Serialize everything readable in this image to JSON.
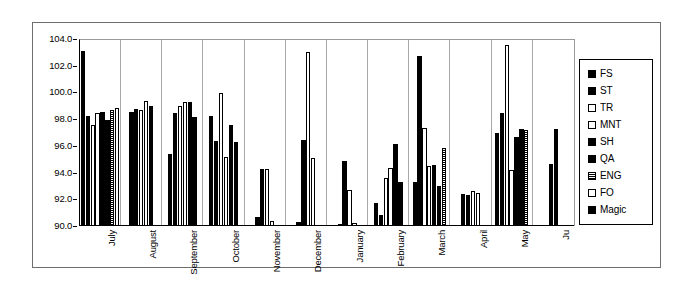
{
  "chart_data": {
    "type": "bar",
    "title": "",
    "xlabel": "",
    "ylabel": "",
    "ylim": [
      90.0,
      104.0
    ],
    "ytick_step": 2.0,
    "ytick_labels": [
      "104.0",
      "102.0",
      "100.0",
      "98.0",
      "96.0",
      "94.0",
      "92.0",
      "90.0"
    ],
    "grid": false,
    "legend_position": "right",
    "categories": [
      "July",
      "August",
      "September",
      "October",
      "November",
      "December",
      "January",
      "February",
      "March",
      "April",
      "May",
      "Ju"
    ],
    "legend": [
      "FS",
      "ST",
      "TR",
      "MNT",
      "SH",
      "QA",
      "ENG",
      "FO",
      "Magic"
    ],
    "series": [
      {
        "name": "FS",
        "fill": "solid",
        "values": [
          103.2,
          98.6,
          95.4,
          98.3,
          90.7,
          90.3,
          90.1,
          91.7,
          93.3,
          92.4,
          97.0,
          94.7
        ]
      },
      {
        "name": "ST",
        "fill": "solid",
        "values": [
          98.3,
          98.8,
          98.5,
          96.4,
          94.3,
          96.5,
          94.9,
          90.8,
          102.8,
          92.3,
          98.5,
          97.3
        ]
      },
      {
        "name": "TR",
        "fill": "open",
        "values": [
          97.6,
          98.7,
          99.0,
          100.0,
          94.3,
          103.1,
          92.7,
          93.6,
          97.4,
          92.6,
          103.6,
          null
        ]
      },
      {
        "name": "MNT",
        "fill": "open",
        "values": [
          98.5,
          99.4,
          99.3,
          95.2,
          90.4,
          95.1,
          90.2,
          94.4,
          94.5,
          92.5,
          94.2,
          null
        ]
      },
      {
        "name": "SH",
        "fill": "solid",
        "values": [
          98.6,
          99.0,
          99.3,
          97.6,
          null,
          null,
          null,
          96.2,
          94.6,
          null,
          96.7,
          null
        ]
      },
      {
        "name": "QA",
        "fill": "solid",
        "values": [
          98.0,
          null,
          98.2,
          96.3,
          null,
          null,
          null,
          93.3,
          93.0,
          null,
          97.3,
          null
        ]
      },
      {
        "name": "ENG",
        "fill": "hatch",
        "values": [
          98.7,
          null,
          null,
          null,
          null,
          null,
          null,
          null,
          95.9,
          null,
          97.2,
          null
        ]
      },
      {
        "name": "FO",
        "fill": "open",
        "values": [
          98.9,
          null,
          null,
          null,
          null,
          null,
          null,
          null,
          null,
          null,
          null,
          null
        ]
      },
      {
        "name": "Magic",
        "fill": "solid",
        "values": [
          null,
          null,
          null,
          null,
          null,
          null,
          null,
          null,
          null,
          null,
          null,
          null
        ]
      }
    ]
  }
}
